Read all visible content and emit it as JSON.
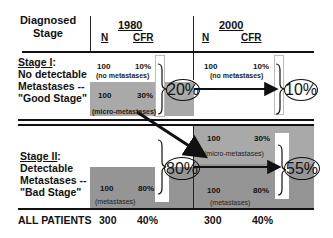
{
  "header": {
    "row_label": "Diagnosed\nStage",
    "row_label_line1": "Diagnosed",
    "row_label_line2": "Stage",
    "periods": [
      {
        "year": "1980",
        "col_n": "N",
        "col_cfr": "CFR"
      },
      {
        "year": "2000",
        "col_n": "N",
        "col_cfr": "CFR"
      }
    ]
  },
  "stages": [
    {
      "title": "Stage I",
      "title_suffix": ":",
      "desc_line1": "No detectable",
      "desc_line2": "Metastases --",
      "desc_line3": "\"Good Stage\""
    },
    {
      "title": "Stage II",
      "title_suffix": ":",
      "desc_line1": "Detectable",
      "desc_line2": "Metastases --",
      "desc_line3": "\"Bad Stage\""
    }
  ],
  "cells_1980": [
    {
      "n": "100",
      "cfr": "10%",
      "note": "(no metastases)"
    },
    {
      "n": "100",
      "cfr": "30%",
      "note": "(micro-metastases)"
    },
    {
      "n": "100",
      "cfr": "80%",
      "note": "(metastases)"
    }
  ],
  "cells_2000": [
    {
      "n": "100",
      "cfr": "10%",
      "note": "(no metastases)"
    },
    {
      "n": "100",
      "cfr": "30%",
      "note": "(micro-metastases)"
    },
    {
      "n": "100",
      "cfr": "80%",
      "note": "(metastases)"
    }
  ],
  "stage_cfr": {
    "y1980_stage1": "20%",
    "y1980_stage2": "80%",
    "y2000_stage1": "10%",
    "y2000_stage2": "55%"
  },
  "totals": {
    "label": "ALL PATIENTS",
    "y1980_n": "300",
    "y1980_cfr": "40%",
    "y2000_n": "300",
    "y2000_cfr": "40%"
  },
  "colors": {
    "shade": "#a9a9a9",
    "shade_dark": "#959595",
    "line": "#111111"
  }
}
